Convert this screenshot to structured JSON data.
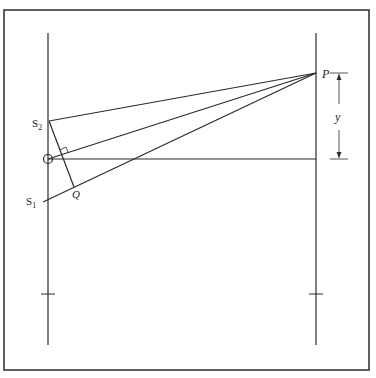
{
  "diagram": {
    "labels": {
      "P": "P",
      "S2": "S",
      "S2_sub": "2",
      "S1": "S",
      "S1_sub": "1",
      "Q": "Q",
      "y": "y"
    },
    "colors": {
      "line": "#2a2a2a",
      "background": "#ffffff"
    },
    "points": {
      "P": [
        316,
        73
      ],
      "S2": [
        49,
        121
      ],
      "S1": [
        44,
        202
      ],
      "O": [
        48,
        159
      ],
      "Q": [
        74,
        187
      ]
    }
  }
}
